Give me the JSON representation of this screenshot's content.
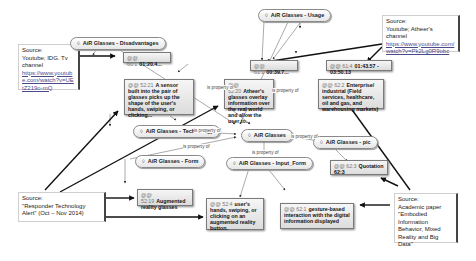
{
  "codes": {
    "disadvantages": "AiR Glasses - Disadvantages",
    "usage": "AiR Glasses - Usage",
    "technology": "AiR Glasses - Technology",
    "glasses": "AiR Glasses",
    "pic": "AiR Glasses - pic",
    "form": "AiR Glasses - Form",
    "input_form": "AiR Glasses - Input_Form"
  },
  "code_icon": "◊",
  "quotes": {
    "q1": {
      "id": "@@ 60:1",
      "text": "01:20.4..."
    },
    "q2": {
      "id": "@@ 61:1",
      "text": "00:39.7..."
    },
    "q3": {
      "id": "@@ 61:4",
      "text": "01:43.57 - 03:50.13"
    },
    "q4": {
      "id": "@@ 52:21",
      "text": "A sensor built into the pair of glasses picks up the shape of the user's hands, swiping, or clicking..."
    },
    "q5": {
      "id": "@@ 52:20",
      "text": "Atheer's glasses overlay information over the real world and allow the user to..."
    },
    "q6": {
      "id": "@@ 62:2",
      "text": "Enterprise/ industrial (Field services, healthcare, oil and gas, and warehousing markets)"
    },
    "q7": {
      "id": "@@ 62:3",
      "text": "Quotation 62:3"
    },
    "q8": {
      "id": "@@ 52:19",
      "text": "Augmented reality glasses"
    },
    "q9": {
      "id": "@@ 52:4",
      "text": "user's hands, swiping, or clicking on an augmented reality button."
    },
    "q10": {
      "id": "@@ 62:1",
      "text": "gesture-based interaction with the digital information displayed"
    }
  },
  "edge_labels": {
    "prop1": "is property of",
    "prop2": "is property of",
    "prop3": "is property of",
    "prop4": "is property of",
    "prop5": "is property of",
    "prop6": "is property of"
  },
  "sources": {
    "idg": {
      "label": "Source:",
      "text": "Youtube; IDG. Tv channel",
      "link": "https://www.youtube.com/watch?v=UEtZ219o-mQ"
    },
    "atheer": {
      "label": "Source:",
      "text": "Youtube; Atheer's channel",
      "link": "https://www.youtube.com/watch?v=Pk2Lg0R9obc"
    },
    "responder": {
      "label": "Source:",
      "text": "\"Responder Technology Alert\" (Oct – Nov 2014)"
    },
    "academic": {
      "label": "Source:",
      "text": "Academic paper \"Embodied Information Behavior, Mixed Reality and Big Data\""
    }
  }
}
